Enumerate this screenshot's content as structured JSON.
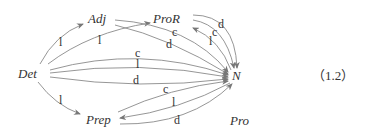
{
  "diagram": {
    "nodes": [
      {
        "id": "det",
        "label": "Det",
        "x": 18,
        "y": 76
      },
      {
        "id": "adj",
        "label": "Adj",
        "x": 88,
        "y": 22
      },
      {
        "id": "pror",
        "label": "ProR",
        "x": 152,
        "y": 22
      },
      {
        "id": "n",
        "label": "N",
        "x": 232,
        "y": 78
      },
      {
        "id": "prep",
        "label": "Prep",
        "x": 86,
        "y": 123
      },
      {
        "id": "pro",
        "label": "Pro",
        "x": 230,
        "y": 124
      }
    ],
    "edges": [
      {
        "from": "Det",
        "to": "Adj",
        "label": "l"
      },
      {
        "from": "Det",
        "to": "ProR",
        "label": "l"
      },
      {
        "from": "Adj",
        "to": "N",
        "label": "c"
      },
      {
        "from": "Adj",
        "to": "N",
        "label": "d"
      },
      {
        "from": "ProR",
        "to": "N",
        "label": "d"
      },
      {
        "from": "ProR",
        "to": "N",
        "label": "c"
      },
      {
        "from": "N",
        "to": "ProR",
        "label": "l"
      },
      {
        "from": "Det",
        "to": "N",
        "label": "c"
      },
      {
        "from": "Det",
        "to": "N",
        "label": "l"
      },
      {
        "from": "Det",
        "to": "N",
        "label": "d"
      },
      {
        "from": "Det",
        "to": "Prep",
        "label": "l"
      },
      {
        "from": "Prep",
        "to": "N",
        "label": "c"
      },
      {
        "from": "N",
        "to": "Prep",
        "label": "l"
      },
      {
        "from": "Prep",
        "to": "N",
        "label": "d"
      }
    ],
    "equation_number": "（1.2）"
  }
}
